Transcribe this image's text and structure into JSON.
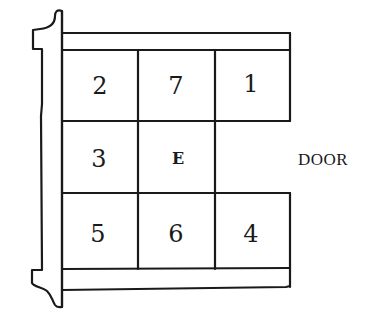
{
  "diagram": {
    "line_color": "#1a1a1a",
    "background": "#ffffff",
    "cells": [
      {
        "row": 0,
        "col": 0,
        "label": "2"
      },
      {
        "row": 0,
        "col": 1,
        "label": "7"
      },
      {
        "row": 0,
        "col": 2,
        "label": "1"
      },
      {
        "row": 1,
        "col": 0,
        "label": "3"
      },
      {
        "row": 1,
        "col": 1,
        "label": "E"
      },
      {
        "row": 1,
        "col": 2,
        "label": ""
      },
      {
        "row": 2,
        "col": 0,
        "label": "5"
      },
      {
        "row": 2,
        "col": 1,
        "label": "6"
      },
      {
        "row": 2,
        "col": 2,
        "label": "4"
      }
    ],
    "labels": {
      "c00": "2",
      "c01": "7",
      "c02": "1",
      "c10": "3",
      "c11": "E",
      "c20": "5",
      "c21": "6",
      "c22": "4",
      "door": "DOOR"
    }
  }
}
